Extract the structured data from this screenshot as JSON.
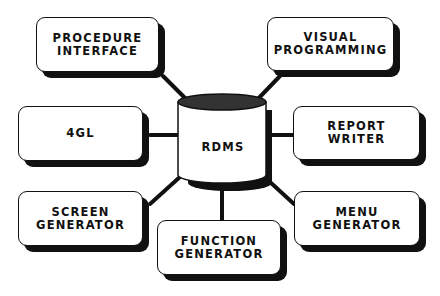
{
  "diagram": {
    "hub": {
      "id": "rdms",
      "label": "RDMS",
      "shape": "cylinder"
    },
    "nodes": [
      {
        "id": "procedure-interface",
        "label": "PROCEDURE\nINTERFACE",
        "position": "top-left"
      },
      {
        "id": "visual-programming",
        "label": "VISUAL\nPROGRAMMING",
        "position": "top-right"
      },
      {
        "id": "4gl",
        "label": "4GL",
        "position": "middle-left"
      },
      {
        "id": "report-writer",
        "label": "REPORT\nWRITER",
        "position": "middle-right"
      },
      {
        "id": "screen-generator",
        "label": "SCREEN\nGENERATOR",
        "position": "bottom-left"
      },
      {
        "id": "function-generator",
        "label": "FUNCTION\nGENERATOR",
        "position": "bottom-center"
      },
      {
        "id": "menu-generator",
        "label": "MENU\nGENERATOR",
        "position": "bottom-right"
      }
    ],
    "edges": [
      [
        "rdms",
        "procedure-interface"
      ],
      [
        "rdms",
        "visual-programming"
      ],
      [
        "rdms",
        "4gl"
      ],
      [
        "rdms",
        "report-writer"
      ],
      [
        "rdms",
        "screen-generator"
      ],
      [
        "rdms",
        "function-generator"
      ],
      [
        "rdms",
        "menu-generator"
      ]
    ],
    "colors": {
      "stroke": "#111111",
      "fill": "#ffffff",
      "shadow": "#111111"
    }
  }
}
